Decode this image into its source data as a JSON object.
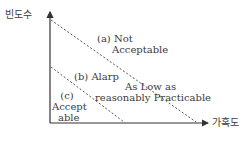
{
  "axes": {
    "y_label": "빈도수",
    "x_label": "가혹도"
  },
  "regions": {
    "a": {
      "line1": "(a) Not",
      "line2": "Acceptable"
    },
    "b": {
      "line1": "(b) Alarp"
    },
    "alarp_desc": {
      "line1": "As Low as",
      "line2": "reasonably Practicable"
    },
    "c": {
      "line1": "(c)",
      "line2": "Accept",
      "line3": "able"
    }
  },
  "colors": {
    "axis": "#333333",
    "dashed": "#555555"
  }
}
